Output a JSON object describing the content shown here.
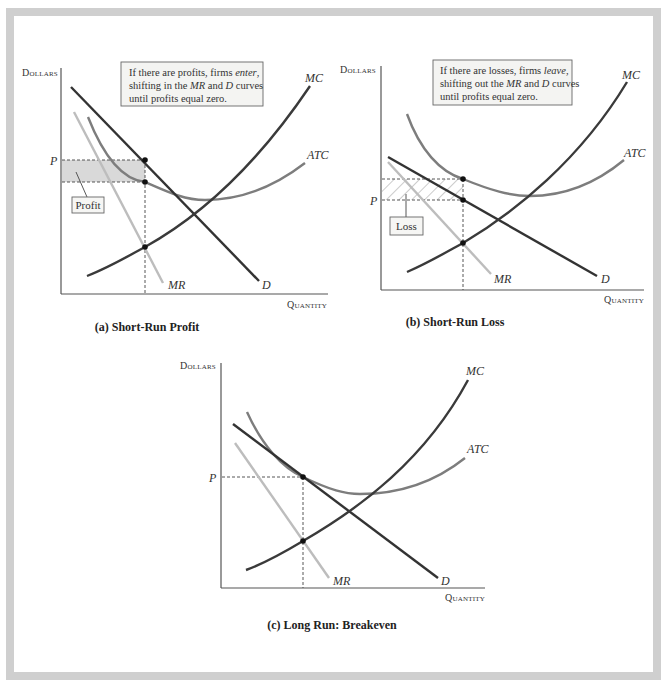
{
  "colors": {
    "frame": "#cfcfcf",
    "axis": "#555555",
    "mc": "#3a3a3a",
    "demand": "#333333",
    "atc": "#7d7d7d",
    "mr": "#bdbdbd",
    "profit_fill": "#d9d9d9",
    "loss_hatch": "#b5b5b5",
    "note_fill": "#f4f4f2",
    "note_border": "#666666"
  },
  "panels": [
    {
      "id": "a",
      "caption": "(a) Short-Run Profit",
      "y_axis_label": "Dollars",
      "x_axis_label": "Quantity",
      "price_label": "P",
      "curves": {
        "mc": "MC",
        "atc": "ATC",
        "mr": "MR",
        "d": "D"
      },
      "note_lines": [
        "If there are profits, firms ",
        "enter",
        ",",
        "shifting in the ",
        "MR",
        " and ",
        "D",
        " curves",
        "until profits equal zero."
      ],
      "area_label": "Profit"
    },
    {
      "id": "b",
      "caption": "(b) Short-Run Loss",
      "y_axis_label": "Dollars",
      "x_axis_label": "Quantity",
      "price_label": "P",
      "curves": {
        "mc": "MC",
        "atc": "ATC",
        "mr": "MR",
        "d": "D"
      },
      "note_lines": [
        "If there are losses, firms ",
        "leave",
        ",",
        "shifting out the ",
        "MR",
        " and ",
        "D",
        " curves",
        "until profits equal zero."
      ],
      "area_label": "Loss"
    },
    {
      "id": "c",
      "caption": "(c) Long Run: Breakeven",
      "y_axis_label": "Dollars",
      "x_axis_label": "Quantity",
      "price_label": "P",
      "curves": {
        "mc": "MC",
        "atc": "ATC",
        "mr": "MR",
        "d": "D"
      }
    }
  ]
}
